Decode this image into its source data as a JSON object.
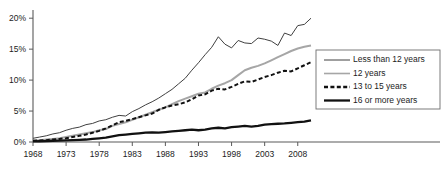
{
  "chart_data": {
    "type": "line",
    "title": "",
    "subtitle": "",
    "xlabel": "",
    "ylabel": "",
    "xlim": [
      1968,
      2010
    ],
    "ylim": [
      0,
      21
    ],
    "grid": false,
    "legend_position": "right",
    "x_tick_labels": [
      "1968",
      "1973",
      "1978",
      "1983",
      "1988",
      "1993",
      "1998",
      "2003",
      "2008"
    ],
    "x_ticks": [
      1968,
      1973,
      1978,
      1983,
      1988,
      1993,
      1998,
      2003,
      2008
    ],
    "y_tick_labels": [
      "0%",
      "5%",
      "10%",
      "15%",
      "20%"
    ],
    "y_ticks": [
      0,
      5,
      10,
      15,
      20
    ],
    "x": [
      1968,
      1969,
      1970,
      1971,
      1972,
      1973,
      1974,
      1975,
      1976,
      1977,
      1978,
      1979,
      1980,
      1981,
      1982,
      1983,
      1984,
      1985,
      1986,
      1987,
      1988,
      1989,
      1990,
      1991,
      1992,
      1993,
      1994,
      1995,
      1996,
      1997,
      1998,
      1999,
      2000,
      2001,
      2002,
      2003,
      2004,
      2005,
      2006,
      2007,
      2008,
      2009,
      2010
    ],
    "series": [
      {
        "name": "Less than 12 years",
        "style": "solid-thin",
        "color": "#404040",
        "width": 1.0,
        "values": [
          0.6,
          0.8,
          1.0,
          1.3,
          1.5,
          1.9,
          2.2,
          2.4,
          2.8,
          3.0,
          3.4,
          3.6,
          4.0,
          4.3,
          4.2,
          4.9,
          5.4,
          6.0,
          6.5,
          7.1,
          7.8,
          8.5,
          9.4,
          10.3,
          11.6,
          12.8,
          14.1,
          15.3,
          17.0,
          15.8,
          15.2,
          16.4,
          16.0,
          15.9,
          16.8,
          16.6,
          16.3,
          15.6,
          17.6,
          17.2,
          18.8,
          19.0,
          20.0
        ]
      },
      {
        "name": "12 years",
        "style": "solid-gray",
        "color": "#a6a6a6",
        "width": 2.0,
        "values": [
          0.2,
          0.3,
          0.4,
          0.5,
          0.6,
          0.8,
          1.0,
          1.2,
          1.4,
          1.6,
          1.9,
          2.1,
          2.6,
          2.9,
          3.2,
          3.6,
          4.0,
          4.4,
          4.8,
          5.2,
          5.6,
          6.1,
          6.6,
          7.0,
          7.4,
          7.8,
          8.0,
          8.6,
          9.1,
          9.5,
          10.0,
          10.8,
          11.6,
          12.0,
          12.3,
          12.7,
          13.2,
          13.7,
          14.2,
          14.7,
          15.1,
          15.4,
          15.6
        ]
      },
      {
        "name": "13 to 15 years",
        "style": "dashed",
        "color": "#111111",
        "width": 2.0,
        "values": [
          0.2,
          0.25,
          0.3,
          0.4,
          0.5,
          0.6,
          0.8,
          1.0,
          1.2,
          1.5,
          1.8,
          2.2,
          2.7,
          3.2,
          3.4,
          3.7,
          4.0,
          4.3,
          4.6,
          5.2,
          5.6,
          5.9,
          6.1,
          6.4,
          6.9,
          7.5,
          7.7,
          8.3,
          8.6,
          8.5,
          8.9,
          9.4,
          9.8,
          9.7,
          10.1,
          10.5,
          10.8,
          11.2,
          11.5,
          11.4,
          11.9,
          12.4,
          12.9
        ]
      },
      {
        "name": "16 or more years",
        "style": "solid-thick",
        "color": "#111111",
        "width": 2.3,
        "values": [
          0.1,
          0.12,
          0.15,
          0.2,
          0.22,
          0.25,
          0.3,
          0.35,
          0.4,
          0.5,
          0.6,
          0.7,
          0.9,
          1.1,
          1.2,
          1.3,
          1.4,
          1.5,
          1.55,
          1.5,
          1.6,
          1.7,
          1.8,
          1.9,
          2.0,
          1.9,
          2.0,
          2.2,
          2.3,
          2.2,
          2.4,
          2.5,
          2.6,
          2.5,
          2.6,
          2.8,
          2.9,
          2.95,
          3.0,
          3.1,
          3.2,
          3.3,
          3.5
        ]
      }
    ],
    "legend": [
      {
        "label": "Less than 12 years",
        "style": "solid-thin",
        "color": "#404040"
      },
      {
        "label": "12 years",
        "style": "solid-gray",
        "color": "#a6a6a6"
      },
      {
        "label": "13 to 15 years",
        "style": "dashed",
        "color": "#111111"
      },
      {
        "label": "16 or more years",
        "style": "solid-thick",
        "color": "#111111"
      }
    ]
  }
}
